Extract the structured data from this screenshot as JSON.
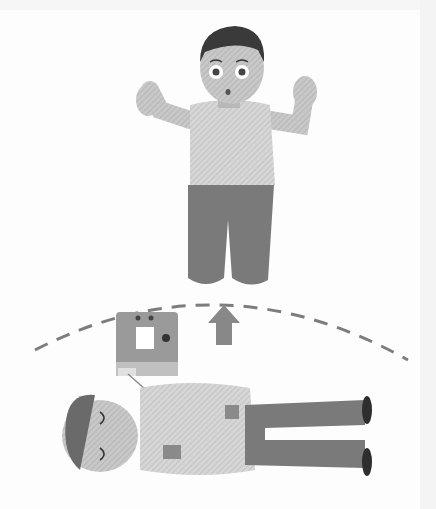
{
  "illustration": {
    "subject": "AED stand-clear scene",
    "figures": [
      {
        "id": "rescuer",
        "pose": "kneeling, hands raised, surprised expression"
      },
      {
        "id": "patient",
        "pose": "lying on back, eyes closed, AED pads on chest"
      }
    ],
    "objects": [
      {
        "id": "aed-device",
        "desc": "defibrillator with screen and two indicator lights, cable to pads"
      },
      {
        "id": "up-arrow",
        "desc": "arrow pointing up toward rescuer"
      },
      {
        "id": "dashed-arc",
        "desc": "dashed curved line separating rescuer from patient"
      }
    ],
    "colors": {
      "background": "#fdfdfd",
      "hair": "#3a3a3a",
      "skin": "#c4c4c4",
      "shirt": "#d9d9d9",
      "pants": "#7a7a7a",
      "aed": "#9a9a9a",
      "arrow": "#888888",
      "dash": "#7d7d7d",
      "shoes": "#2e2e2e"
    }
  }
}
